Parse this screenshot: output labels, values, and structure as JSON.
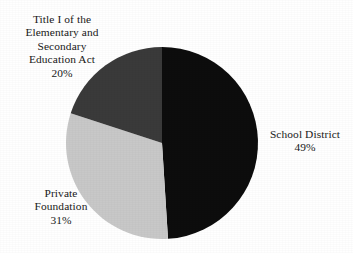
{
  "chart_data": {
    "type": "pie",
    "title": "",
    "subtitle": "",
    "xlabel": "",
    "ylabel": "",
    "legend_position": "none",
    "grid": false,
    "start_angle_deg": 0,
    "direction": "clockwise",
    "categories": [
      "School District",
      "Private Foundation",
      "Title I of the Elementary and Secondary Education Act"
    ],
    "values": [
      49,
      31,
      20
    ],
    "unit": "%",
    "slices": [
      {
        "name": "School District",
        "value": 49,
        "value_label": "49%",
        "color": "#0d0d0d",
        "label_lines": [
          "School District",
          "49%"
        ],
        "label_position": "right"
      },
      {
        "name": "Private Foundation",
        "value": 31,
        "value_label": "31%",
        "color": "#c8c8c8",
        "label_lines": [
          "Private",
          "Foundation",
          "31%"
        ],
        "label_position": "bottom-left"
      },
      {
        "name": "Title I of the Elementary and Secondary Education Act",
        "value": 20,
        "value_label": "20%",
        "color": "#3a3a3a",
        "label_lines": [
          "Title I of the",
          "Elementary and",
          "Secondary",
          "Education Act",
          "20%"
        ],
        "label_position": "top-left"
      }
    ]
  },
  "labels": {
    "title_i": {
      "line1": "Title I of the",
      "line2": "Elementary and",
      "line3": "Secondary",
      "line4": "Education Act",
      "value": "20%"
    },
    "school_district": {
      "name": "School District",
      "value": "49%"
    },
    "private_foundation": {
      "line1": "Private",
      "line2": "Foundation",
      "value": "31%"
    }
  },
  "colors": {
    "background": "#ffffff",
    "text": "#181818",
    "school_district": "#0d0d0d",
    "private_foundation": "#c8c8c8",
    "title_i": "#3a3a3a"
  },
  "geometry": {
    "center_x": 162,
    "center_y": 143,
    "radius": 96
  }
}
